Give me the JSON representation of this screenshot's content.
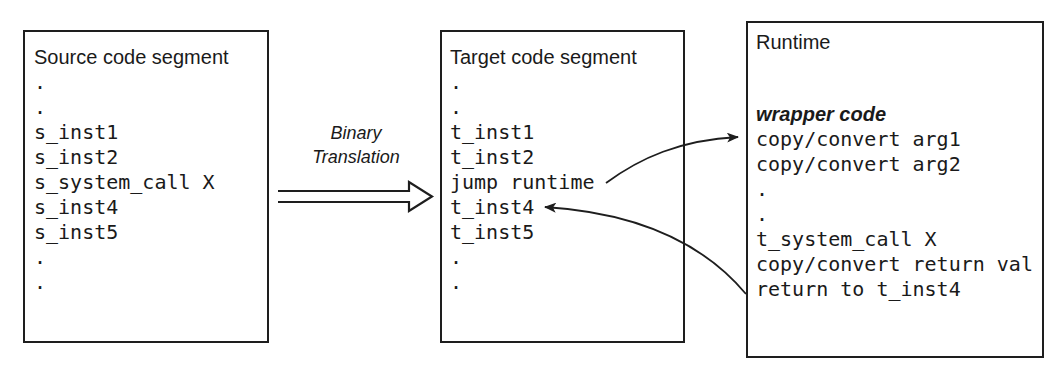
{
  "source_segment": {
    "title": "Source code segment",
    "lines": [
      ".",
      ".",
      "s_inst1",
      "s_inst2",
      "s_system_call X",
      "s_inst4",
      "s_inst5",
      ".",
      "."
    ]
  },
  "translation_arrow": {
    "label_line1": "Binary",
    "label_line2": "Translation"
  },
  "target_segment": {
    "title": "Target code segment",
    "lines": [
      ".",
      ".",
      "t_inst1",
      "t_inst2",
      "jump runtime",
      "t_inst4",
      "t_inst5",
      ".",
      "."
    ]
  },
  "runtime": {
    "title": "Runtime",
    "wrapper_label": "wrapper code",
    "lines": [
      "copy/convert arg1",
      "copy/convert arg2",
      ".",
      ".",
      "t_system_call X",
      "copy/convert return val",
      "return to t_inst4"
    ]
  },
  "arrows": {
    "jump_to_runtime": "jump runtime -> wrapper code",
    "return_to_target": "return to t_inst4 -> t_inst4"
  },
  "colors": {
    "stroke": "#1e1e1e",
    "text": "#1a1a1a",
    "background": "#ffffff"
  }
}
